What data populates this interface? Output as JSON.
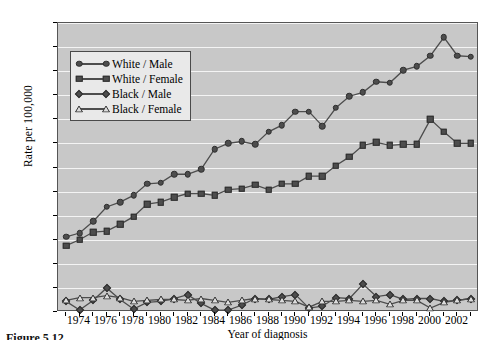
{
  "figure": {
    "caption": "Figure 5.12",
    "background_color": "#ffffff",
    "plot_background_color": "#c8c8c8",
    "gridline_color": "#f4f4f4",
    "series_color": "#4d4d4d"
  },
  "chart_data": {
    "type": "line",
    "title": "",
    "xlabel": "Year of diagnosis",
    "ylabel": "Rate per 100,000",
    "xlim": [
      1972.4,
      2003.6
    ],
    "ylim": [
      0,
      30
    ],
    "grid": true,
    "legend_position": "upper-left-inside",
    "yticks": [
      "0",
      "2.5",
      "5.0",
      "7.5",
      "10.0",
      "12.5",
      "15.0",
      "17.5",
      "20.0",
      "22.5",
      "25.0",
      "27.5",
      "30.0"
    ],
    "ytick_values": [
      0,
      2.5,
      5.0,
      7.5,
      10.0,
      12.5,
      15.0,
      17.5,
      20.0,
      22.5,
      25.0,
      27.5,
      30.0
    ],
    "xticks": [
      "1974",
      "1976",
      "1978",
      "1980",
      "1982",
      "1984",
      "1986",
      "1988",
      "1990",
      "1992",
      "1994",
      "1996",
      "1998",
      "2000",
      "2002"
    ],
    "xtick_values": [
      1974,
      1976,
      1978,
      1980,
      1982,
      1984,
      1986,
      1988,
      1990,
      1992,
      1994,
      1996,
      1998,
      2000,
      2002
    ],
    "x": [
      1973,
      1974,
      1975,
      1976,
      1977,
      1978,
      1979,
      1980,
      1981,
      1982,
      1983,
      1984,
      1985,
      1986,
      1987,
      1988,
      1989,
      1990,
      1991,
      1992,
      1993,
      1994,
      1995,
      1996,
      1997,
      1998,
      1999,
      2000,
      2001,
      2002,
      2003
    ],
    "series": [
      {
        "name": "White / Male",
        "marker": "circle",
        "filled": true,
        "values": [
          7.8,
          8.2,
          9.4,
          10.9,
          11.4,
          12.1,
          13.3,
          13.4,
          14.3,
          14.3,
          14.8,
          16.9,
          17.5,
          17.7,
          17.4,
          18.7,
          19.4,
          20.8,
          20.8,
          19.3,
          21.2,
          22.4,
          22.8,
          23.9,
          23.8,
          25.1,
          25.5,
          26.6,
          28.5,
          26.6,
          26.5
        ]
      },
      {
        "name": "White / Female",
        "marker": "square",
        "filled": true,
        "values": [
          6.9,
          7.5,
          8.3,
          8.4,
          9.1,
          9.9,
          11.2,
          11.4,
          11.9,
          12.3,
          12.3,
          12.1,
          12.7,
          12.8,
          13.2,
          12.7,
          13.3,
          13.3,
          14.1,
          14.1,
          15.2,
          16.1,
          17.3,
          17.6,
          17.3,
          17.4,
          17.4,
          20.0,
          18.7,
          17.5,
          17.5
        ]
      },
      {
        "name": "Black / Male",
        "marker": "diamond",
        "filled": true,
        "values": [
          1.1,
          0.2,
          1.2,
          2.5,
          1.3,
          0.3,
          1.0,
          1.1,
          1.4,
          1.8,
          0.9,
          0.2,
          0.2,
          0.7,
          1.4,
          1.3,
          1.6,
          1.8,
          0.4,
          0.6,
          1.5,
          1.4,
          2.9,
          1.6,
          1.8,
          1.3,
          1.4,
          1.4,
          1.1,
          1.2,
          1.4
        ]
      },
      {
        "name": "Black / Female",
        "marker": "triangle",
        "filled": false,
        "values": [
          1.2,
          1.5,
          1.5,
          1.7,
          1.5,
          1.1,
          1.2,
          1.3,
          1.3,
          1.2,
          1.4,
          1.2,
          1.0,
          1.2,
          1.4,
          1.3,
          1.2,
          1.1,
          0.5,
          1.1,
          1.1,
          1.2,
          1.1,
          1.2,
          0.8,
          1.2,
          1.2,
          0.4,
          1.0,
          1.2,
          1.4
        ]
      }
    ]
  },
  "legend": {
    "items": [
      {
        "label": "White / Male",
        "marker": "circle"
      },
      {
        "label": "White / Female",
        "marker": "square"
      },
      {
        "label": "Black / Male",
        "marker": "diamond"
      },
      {
        "label": "Black / Female",
        "marker": "triangle"
      }
    ]
  }
}
